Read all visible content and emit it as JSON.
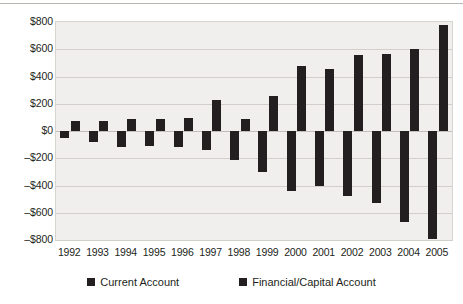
{
  "chart_data": {
    "type": "bar",
    "title": "",
    "subtitle": "",
    "xlabel": "",
    "ylabel": "",
    "grid": true,
    "legend_position": "bottom",
    "categories": [
      "1992",
      "1993",
      "1994",
      "1995",
      "1996",
      "1997",
      "1998",
      "1999",
      "2000",
      "2001",
      "2002",
      "2003",
      "2004",
      "2005"
    ],
    "ylim": [
      -800,
      800
    ],
    "ytick_values": [
      800,
      600,
      400,
      200,
      0,
      -200,
      -400,
      -600,
      -800
    ],
    "ytick_labels": [
      "$800",
      "$600",
      "$400",
      "$200",
      "$0",
      "–$200",
      "–$400",
      "–$600",
      "–$800"
    ],
    "series": [
      {
        "name": "Current Account",
        "color": "#231f20",
        "values": [
          -50,
          -80,
          -120,
          -110,
          -120,
          -140,
          -215,
          -300,
          -440,
          -400,
          -475,
          -530,
          -665,
          -790
        ]
      },
      {
        "name": "Financial/Capital Account",
        "color": "#231f20",
        "values": [
          70,
          75,
          90,
          85,
          95,
          230,
          85,
          255,
          475,
          455,
          555,
          565,
          600,
          780
        ]
      }
    ]
  },
  "legend": {
    "items": [
      {
        "label": "Current Account",
        "color": "#231f20"
      },
      {
        "label": "Financial/Capital Account",
        "color": "#231f20"
      }
    ]
  },
  "colors": {
    "bar": "#231f20",
    "plot_background": "#f0efed",
    "gridline": "#d2cfcb",
    "plot_border": "#d8d5d1",
    "text": "#231f20",
    "page_background": "#ffffff"
  }
}
